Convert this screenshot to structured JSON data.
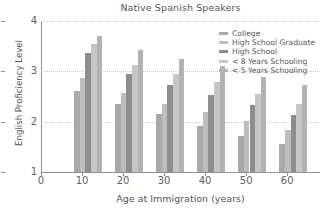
{
  "chart_data": {
    "type": "bar",
    "title": "Native Spanish Speakers",
    "xlabel": "Age at Immigration (years)",
    "ylabel": "English Proficiency Level",
    "categories": [
      "10",
      "20",
      "30",
      "40",
      "50",
      "60"
    ],
    "xtick_labels": [
      "0",
      "10",
      "20",
      "30",
      "40",
      "50",
      "60"
    ],
    "xtick_values": [
      0,
      10,
      20,
      30,
      40,
      50,
      60
    ],
    "ytick_labels": [
      "1",
      "2",
      "3",
      "4"
    ],
    "ytick_values": [
      1,
      2,
      3,
      4
    ],
    "ylim": [
      1,
      4
    ],
    "xlim": [
      0,
      68
    ],
    "grid": "horizontal-dotted",
    "legend_position": "top-right",
    "series": [
      {
        "name": "College",
        "color": "#a9a9a9",
        "values": [
          2.6,
          2.36,
          2.16,
          1.92,
          1.72,
          1.55
        ]
      },
      {
        "name": "High School Graduate",
        "color": "#bdbdbd",
        "values": [
          2.87,
          2.57,
          2.36,
          2.2,
          2.01,
          1.83
        ]
      },
      {
        "name": "High School",
        "color": "#8d8d8d",
        "values": [
          3.36,
          2.94,
          2.72,
          2.54,
          2.33,
          2.14
        ]
      },
      {
        "name": "< 8 Years Schooling",
        "color": "#c6c6c6",
        "values": [
          3.54,
          3.13,
          2.94,
          2.78,
          2.55,
          2.36
        ]
      },
      {
        "name": "< 5 Years Schooling",
        "color": "#b2b2b2",
        "values": [
          3.7,
          3.42,
          3.25,
          3.1,
          2.88,
          2.72
        ]
      }
    ]
  },
  "legend": {
    "entries": [
      "College",
      "High School Graduate",
      "High School",
      "< 8 Years Schooling",
      "< 5 Years Schooling"
    ]
  }
}
